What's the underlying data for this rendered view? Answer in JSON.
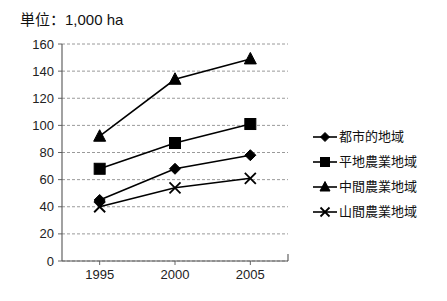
{
  "chart_data": {
    "type": "line",
    "title": "単位：1,000 ha",
    "xlabel": "",
    "ylabel": "",
    "categories": [
      "1995",
      "2000",
      "2005"
    ],
    "x": [
      1995,
      2000,
      2005
    ],
    "ylim": [
      0,
      160
    ],
    "yticks": [
      0,
      20,
      40,
      60,
      80,
      100,
      120,
      140,
      160
    ],
    "ytick_labels": [
      "0",
      "20",
      "40",
      "60",
      "80",
      "100",
      "120",
      "140",
      "160"
    ],
    "grid": true,
    "legend_position": "right",
    "series": [
      {
        "name": "都市的地域",
        "marker": "diamond",
        "color": "#000000",
        "values": [
          45,
          68,
          78
        ]
      },
      {
        "name": "平地農業地域",
        "marker": "square",
        "color": "#000000",
        "values": [
          68,
          87,
          101
        ]
      },
      {
        "name": "中間農業地域",
        "marker": "triangle",
        "color": "#000000",
        "values": [
          92,
          134,
          149
        ]
      },
      {
        "name": "山間農業地域",
        "marker": "x",
        "color": "#000000",
        "values": [
          40,
          54,
          61
        ]
      }
    ]
  },
  "legend": {
    "items": [
      {
        "label": "都市的地域",
        "marker": "diamond"
      },
      {
        "label": "平地農業地域",
        "marker": "square"
      },
      {
        "label": "中間農業地域",
        "marker": "triangle"
      },
      {
        "label": "山間農業地域",
        "marker": "x"
      }
    ]
  },
  "axes": {
    "y_labels": [
      "160",
      "140",
      "120",
      "100",
      "80",
      "60",
      "40",
      "20",
      "0"
    ],
    "x_labels": [
      "1995",
      "2000",
      "2005"
    ]
  }
}
